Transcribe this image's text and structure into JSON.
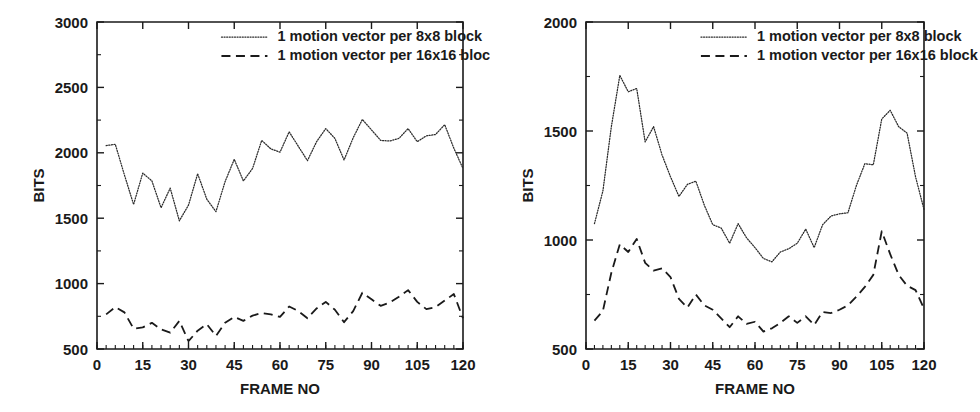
{
  "figure": {
    "panels": [
      "left",
      "right"
    ]
  },
  "chart_data": [
    {
      "id": "left",
      "type": "line",
      "title": "",
      "xlabel": "FRAME NO",
      "ylabel": "BITS",
      "xlim": [
        0,
        120
      ],
      "ylim": [
        500,
        3000
      ],
      "xticks": [
        0,
        15,
        30,
        45,
        60,
        75,
        90,
        105,
        120
      ],
      "yticks": [
        500,
        1000,
        1500,
        2000,
        2500,
        3000
      ],
      "xtick_labels": [
        "0",
        "15",
        "30",
        "45",
        "60",
        "75",
        "90",
        "105",
        "120"
      ],
      "ytick_labels": [
        "500",
        "1000",
        "1500",
        "2000",
        "2500",
        "3000"
      ],
      "x_minor_step": 3,
      "grid": false,
      "legend_position": "top-center",
      "series": [
        {
          "name": "1 motion vector per 8x8 block",
          "style": "dotted",
          "x": [
            3,
            6,
            9,
            12,
            15,
            18,
            21,
            24,
            27,
            30,
            33,
            36,
            39,
            42,
            45,
            48,
            51,
            54,
            57,
            60,
            63,
            66,
            69,
            72,
            75,
            78,
            81,
            84,
            87,
            90,
            93,
            96,
            99,
            102,
            105,
            108,
            111,
            114,
            117,
            120
          ],
          "values": [
            2055,
            2065,
            1830,
            1605,
            1845,
            1785,
            1580,
            1730,
            1480,
            1600,
            1840,
            1645,
            1550,
            1780,
            1950,
            1785,
            1880,
            2095,
            2030,
            2005,
            2160,
            2050,
            1940,
            2085,
            2185,
            2110,
            1945,
            2115,
            2255,
            2175,
            2095,
            2090,
            2110,
            2185,
            2085,
            2130,
            2140,
            2215,
            2035,
            1880
          ]
        },
        {
          "name": "1 motion vector per 16x16 block",
          "style": "dashed",
          "x": [
            3,
            6,
            9,
            12,
            15,
            18,
            21,
            24,
            27,
            30,
            33,
            36,
            39,
            42,
            45,
            48,
            51,
            54,
            57,
            60,
            63,
            66,
            69,
            72,
            75,
            78,
            81,
            84,
            87,
            90,
            93,
            96,
            99,
            102,
            105,
            108,
            111,
            114,
            117,
            120
          ],
          "values": [
            765,
            820,
            780,
            655,
            665,
            700,
            650,
            625,
            715,
            560,
            640,
            690,
            600,
            700,
            745,
            715,
            755,
            775,
            765,
            745,
            825,
            790,
            735,
            810,
            860,
            800,
            705,
            790,
            930,
            880,
            830,
            855,
            900,
            950,
            860,
            805,
            820,
            870,
            920,
            735
          ]
        }
      ]
    },
    {
      "id": "right",
      "type": "line",
      "title": "",
      "xlabel": "FRAME NO",
      "ylabel": "BITS",
      "xlim": [
        0,
        120
      ],
      "ylim": [
        500,
        2000
      ],
      "xticks": [
        0,
        15,
        30,
        45,
        60,
        75,
        90,
        105,
        120
      ],
      "yticks": [
        500,
        1000,
        1500,
        2000
      ],
      "xtick_labels": [
        "0",
        "15",
        "30",
        "45",
        "60",
        "75",
        "90",
        "105",
        "120"
      ],
      "ytick_labels": [
        "500",
        "1000",
        "1500",
        "2000"
      ],
      "x_minor_step": 3,
      "grid": false,
      "legend_position": "top-center",
      "series": [
        {
          "name": "1 motion vector per 8x8 block",
          "style": "dotted",
          "x": [
            3,
            6,
            9,
            12,
            15,
            18,
            21,
            24,
            27,
            30,
            33,
            36,
            39,
            42,
            45,
            48,
            51,
            54,
            57,
            60,
            63,
            66,
            69,
            72,
            75,
            78,
            81,
            84,
            87,
            90,
            93,
            96,
            99,
            102,
            105,
            108,
            111,
            114,
            117,
            120
          ],
          "values": [
            1075,
            1225,
            1520,
            1755,
            1680,
            1695,
            1450,
            1520,
            1390,
            1290,
            1200,
            1255,
            1270,
            1160,
            1070,
            1055,
            985,
            1075,
            1010,
            965,
            915,
            900,
            945,
            960,
            985,
            1050,
            965,
            1070,
            1110,
            1120,
            1125,
            1250,
            1350,
            1345,
            1555,
            1595,
            1520,
            1490,
            1290,
            1140
          ]
        },
        {
          "name": "1 motion vector per 16x16 block",
          "style": "dashed",
          "x": [
            3,
            6,
            9,
            12,
            15,
            18,
            21,
            24,
            27,
            30,
            33,
            36,
            39,
            42,
            45,
            48,
            51,
            54,
            57,
            60,
            63,
            66,
            69,
            72,
            75,
            78,
            81,
            84,
            87,
            90,
            93,
            96,
            99,
            102,
            105,
            108,
            111,
            114,
            117,
            120
          ],
          "values": [
            630,
            675,
            850,
            980,
            945,
            1005,
            895,
            860,
            870,
            830,
            730,
            690,
            750,
            700,
            680,
            640,
            600,
            650,
            615,
            625,
            580,
            595,
            620,
            650,
            620,
            650,
            610,
            670,
            665,
            680,
            700,
            740,
            785,
            840,
            1040,
            935,
            840,
            790,
            770,
            685
          ]
        }
      ]
    }
  ]
}
